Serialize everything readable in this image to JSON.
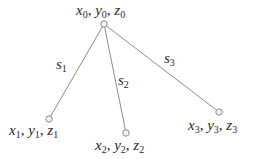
{
  "diagram": {
    "type": "tree",
    "colors": {
      "edge": "#8c8c8c",
      "node_stroke": "#8c8c8c",
      "node_fill": "#f2f2f2",
      "text": "#2a2a2a",
      "background": "#ffffff"
    },
    "nodes": [
      {
        "id": "n0",
        "x": 104,
        "y": 24,
        "label": {
          "var1": "x",
          "sub1": "0",
          "var2": "y",
          "sub2": "0",
          "var3": "z",
          "sub3": "0"
        }
      },
      {
        "id": "n1",
        "x": 49,
        "y": 119,
        "label": {
          "var1": "x",
          "sub1": "1",
          "var2": "y",
          "sub2": "1",
          "var3": "z",
          "sub3": "1"
        }
      },
      {
        "id": "n2",
        "x": 126,
        "y": 133,
        "label": {
          "var1": "x",
          "sub1": "2",
          "var2": "y",
          "sub2": "2",
          "var3": "z",
          "sub3": "2"
        }
      },
      {
        "id": "n3",
        "x": 219,
        "y": 112,
        "label": {
          "var1": "x",
          "sub1": "3",
          "var2": "y",
          "sub2": "3",
          "var3": "z",
          "sub3": "3"
        }
      }
    ],
    "edges": [
      {
        "from": "n0",
        "to": "n1",
        "label": {
          "var": "s",
          "sub": "1"
        }
      },
      {
        "from": "n0",
        "to": "n2",
        "label": {
          "var": "s",
          "sub": "2"
        }
      },
      {
        "from": "n0",
        "to": "n3",
        "label": {
          "var": "s",
          "sub": "3"
        }
      }
    ],
    "separator": ", "
  }
}
